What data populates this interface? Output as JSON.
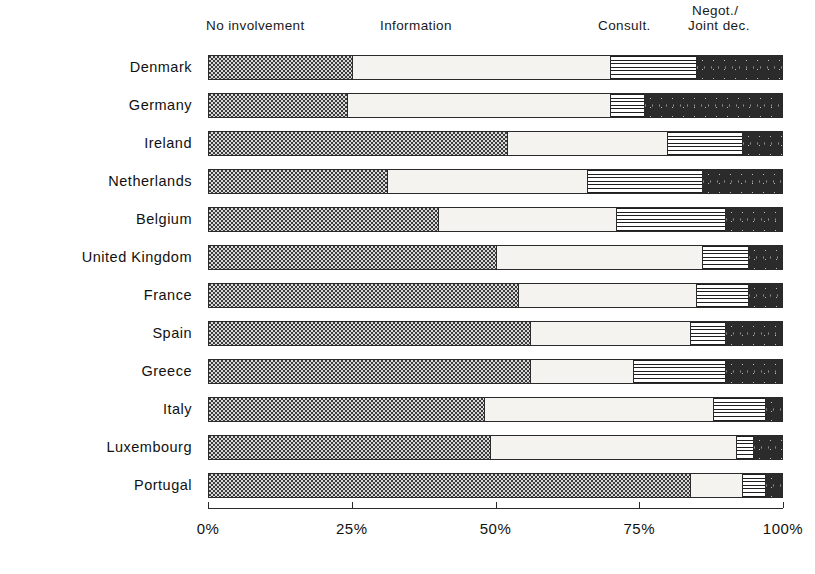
{
  "chart_data": {
    "type": "bar",
    "orientation": "horizontal",
    "stacked": true,
    "normalized_percent": true,
    "title": "",
    "xlabel": "",
    "ylabel": "",
    "xlim": [
      0,
      100
    ],
    "grid": false,
    "legend_position": "top (column headers above bars)",
    "xticks": [
      "0%",
      "25%",
      "50%",
      "75%",
      "100%"
    ],
    "xtick_values": [
      0,
      25,
      50,
      75,
      100
    ],
    "series_names": [
      "No involvement",
      "Information",
      "Consult.",
      "Negot./ Joint dec."
    ],
    "categories": [
      "Denmark",
      "Germany",
      "Ireland",
      "Netherlands",
      "Belgium",
      "United Kingdom",
      "France",
      "Spain",
      "Greece",
      "Italy",
      "Luxembourg",
      "Portugal"
    ],
    "series": [
      {
        "name": "No involvement",
        "values": [
          25,
          24,
          52,
          31,
          40,
          50,
          54,
          56,
          56,
          48,
          49,
          84
        ]
      },
      {
        "name": "Information",
        "values": [
          45,
          46,
          28,
          35,
          31,
          36,
          31,
          28,
          18,
          40,
          43,
          9
        ]
      },
      {
        "name": "Consult.",
        "values": [
          15,
          6,
          13,
          20,
          19,
          8,
          9,
          6,
          16,
          9,
          3,
          4
        ]
      },
      {
        "name": "Negot./ Joint dec.",
        "values": [
          15,
          24,
          7,
          14,
          10,
          6,
          6,
          10,
          10,
          3,
          5,
          3
        ]
      }
    ]
  },
  "headers": {
    "no_involvement": "No involvement",
    "information": "Information",
    "consult": "Consult.",
    "negot_line1": "Negot./",
    "negot_line2": "Joint dec."
  },
  "axis": {
    "tick_0": "0%",
    "tick_25": "25%",
    "tick_50": "50%",
    "tick_75": "75%",
    "tick_100": "100%"
  },
  "countries": {
    "c0": "Denmark",
    "c1": "Germany",
    "c2": "Ireland",
    "c3": "Netherlands",
    "c4": "Belgium",
    "c5": "United Kingdom",
    "c6": "France",
    "c7": "Spain",
    "c8": "Greece",
    "c9": "Italy",
    "c10": "Luxembourg",
    "c11": "Portugal"
  }
}
